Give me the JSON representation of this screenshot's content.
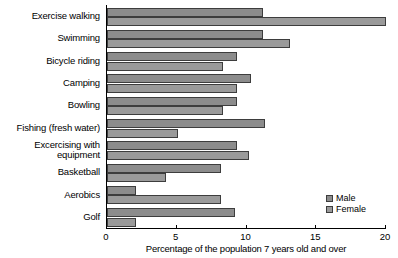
{
  "chart_data": {
    "type": "bar",
    "orientation": "horizontal",
    "title": "",
    "xlabel": "Percentage of the population 7 years old and over",
    "ylabel": "",
    "xlim": [
      0,
      20
    ],
    "xticks": [
      0,
      5,
      10,
      15,
      20
    ],
    "xtick_labels": [
      "0",
      "5",
      "10",
      "15",
      "20"
    ],
    "grid": false,
    "legend_position": "bottom-right",
    "categories": [
      "Exercise walking",
      "Swimming",
      "Bicycle riding",
      "Camping",
      "Bowling",
      "Fishing (fresh water)",
      "Excercising with\nequipment",
      "Basketball",
      "Aerobics",
      "Golf"
    ],
    "series": [
      {
        "name": "Male",
        "color": "#8c8c8c",
        "values": [
          11.2,
          11.2,
          9.3,
          10.3,
          9.3,
          11.3,
          9.3,
          8.2,
          2.1,
          9.2
        ]
      },
      {
        "name": "Female",
        "color": "#9a9a9a",
        "values": [
          20.0,
          13.1,
          8.3,
          9.3,
          8.3,
          5.1,
          10.2,
          4.2,
          8.2,
          2.1
        ]
      }
    ]
  }
}
